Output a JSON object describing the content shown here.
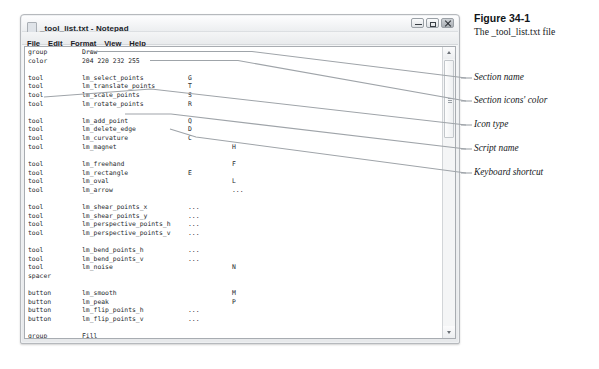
{
  "figure": {
    "number": "Figure 34-1",
    "caption": "The _tool_list.txt file"
  },
  "window": {
    "title": "_tool_list.txt - Notepad",
    "icon": "notepad-document-icon",
    "menu": [
      "File",
      "Edit",
      "Format",
      "View",
      "Help"
    ],
    "controls": {
      "minimize": "Minimize",
      "maximize": "Maximize",
      "close": "Close"
    },
    "scrollbar": {
      "up": "Scroll up",
      "down": "Scroll down",
      "thumb": "Scroll thumb"
    }
  },
  "file": {
    "lines": [
      {
        "c1": "group",
        "c2": "Draw",
        "c3": ""
      },
      {
        "c1": "color",
        "c2": "204 220 232 255",
        "c3": ""
      },
      {
        "c1": "",
        "c2": "",
        "c3": ""
      },
      {
        "c1": "tool",
        "c2": "lm_select_points",
        "c3": "G"
      },
      {
        "c1": "tool",
        "c2": "lm_translate_points",
        "c3": "T"
      },
      {
        "c1": "tool",
        "c2": "lm_scale_points",
        "c3": "S"
      },
      {
        "c1": "tool",
        "c2": "lm_rotate_points",
        "c3": "R"
      },
      {
        "c1": "",
        "c2": "",
        "c3": ""
      },
      {
        "c1": "tool",
        "c2": "lm_add_point",
        "c3": "Q"
      },
      {
        "c1": "tool",
        "c2": "lm_delete_edge",
        "c3": "D"
      },
      {
        "c1": "tool",
        "c2": "lm_curvature",
        "c3": "C"
      },
      {
        "c1": "tool",
        "c2": "lm_magnet",
        "c3": "",
        "c4": "H"
      },
      {
        "c1": "",
        "c2": "",
        "c3": ""
      },
      {
        "c1": "tool",
        "c2": "lm_freehand",
        "c3": "",
        "c4": "F"
      },
      {
        "c1": "tool",
        "c2": "lm_rectangle",
        "c3": "E"
      },
      {
        "c1": "tool",
        "c2": "lm_oval",
        "c3": "",
        "c4": "L"
      },
      {
        "c1": "tool",
        "c2": "lm_arrow",
        "c3": "",
        "c4": "..."
      },
      {
        "c1": "",
        "c2": "",
        "c3": ""
      },
      {
        "c1": "tool",
        "c2": "lm_shear_points_x",
        "c3": "..."
      },
      {
        "c1": "tool",
        "c2": "lm_shear_points_y",
        "c3": "..."
      },
      {
        "c1": "tool",
        "c2": "lm_perspective_points_h",
        "c3": "..."
      },
      {
        "c1": "tool",
        "c2": "lm_perspective_points_v",
        "c3": "..."
      },
      {
        "c1": "",
        "c2": "",
        "c3": ""
      },
      {
        "c1": "tool",
        "c2": "lm_bend_points_h",
        "c3": "..."
      },
      {
        "c1": "tool",
        "c2": "lm_bend_points_v",
        "c3": "..."
      },
      {
        "c1": "tool",
        "c2": "lm_noise",
        "c3": "",
        "c4": "N"
      },
      {
        "c1": "spacer",
        "c2": "",
        "c3": ""
      },
      {
        "c1": "",
        "c2": "",
        "c3": ""
      },
      {
        "c1": "button",
        "c2": "lm_smooth",
        "c3": "",
        "c4": "M"
      },
      {
        "c1": "button",
        "c2": "lm_peak",
        "c3": "",
        "c4": "P"
      },
      {
        "c1": "button",
        "c2": "lm_flip_points_h",
        "c3": "..."
      },
      {
        "c1": "button",
        "c2": "lm_flip_points_v",
        "c3": "..."
      },
      {
        "c1": "",
        "c2": "",
        "c3": ""
      },
      {
        "c1": "group",
        "c2": "Fill",
        "c3": ""
      },
      {
        "c1": "color",
        "c2": "232 220 204 255",
        "c3": ""
      },
      {
        "c1": "tool",
        "c2": "lm_select_shape",
        "c3": "Q"
      },
      {
        "c1": "tool",
        "c2": "lm_create_shape",
        "c3": "U"
      }
    ]
  },
  "annotations": [
    {
      "label": "Section name",
      "top": 72
    },
    {
      "label": "Section icons' color",
      "top": 95
    },
    {
      "label": "Icon type",
      "top": 119
    },
    {
      "label": "Script name",
      "top": 143
    },
    {
      "label": "Keyboard shortcut",
      "top": 167
    }
  ],
  "colors": {
    "text": "#25282c",
    "leader": "#9fa4a9",
    "window_border": "#b6b9bd",
    "page_bg": "#ffffff"
  }
}
